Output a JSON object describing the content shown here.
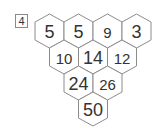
{
  "problem": {
    "number": "4"
  },
  "puzzle": {
    "type": "hexagon-addition-pyramid",
    "rows": [
      [
        {
          "value": "5",
          "given": true
        },
        {
          "value": "5",
          "given": true
        },
        {
          "value": "9",
          "given": false
        },
        {
          "value": "3",
          "given": true
        }
      ],
      [
        {
          "value": "10",
          "given": false
        },
        {
          "value": "14",
          "given": true
        },
        {
          "value": "12",
          "given": false
        }
      ],
      [
        {
          "value": "24",
          "given": true
        },
        {
          "value": "26",
          "given": false
        }
      ],
      [
        {
          "value": "50",
          "given": true
        }
      ]
    ]
  },
  "colors": {
    "hex_border": "#8c8c8c",
    "text": "#333333",
    "background": "#ffffff"
  }
}
